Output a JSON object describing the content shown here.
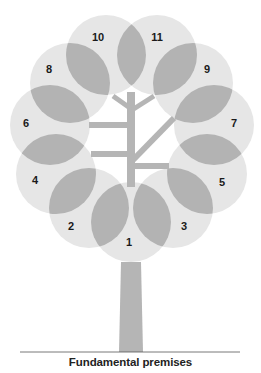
{
  "diagram": {
    "caption": "Fundamental premises",
    "colors": {
      "circle": "#e6e6e6",
      "overlap": "#b3b3b3",
      "trunk": "#b5b5b5",
      "ground": "#555555",
      "label": "#1a1a1a"
    },
    "leaves": [
      {
        "id": "1",
        "label": "1"
      },
      {
        "id": "2",
        "label": "2"
      },
      {
        "id": "3",
        "label": "3"
      },
      {
        "id": "4",
        "label": "4"
      },
      {
        "id": "5",
        "label": "5"
      },
      {
        "id": "6",
        "label": "6"
      },
      {
        "id": "7",
        "label": "7"
      },
      {
        "id": "8",
        "label": "8"
      },
      {
        "id": "9",
        "label": "9"
      },
      {
        "id": "10",
        "label": "10"
      },
      {
        "id": "11",
        "label": "11"
      }
    ]
  }
}
